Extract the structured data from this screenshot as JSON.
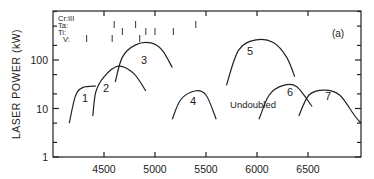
{
  "chart_data": {
    "type": "line",
    "title": "",
    "panel_label": "(a)",
    "xlabel": "",
    "ylabel": "LASER POWER (kW)",
    "xscale": "linear",
    "yscale": "log",
    "xlim": [
      4000,
      7000
    ],
    "ylim": [
      1,
      1000
    ],
    "x_ticks": [
      4500,
      5000,
      5500,
      6000,
      6500
    ],
    "y_ticks": [
      1,
      10,
      100
    ],
    "y_tick_labels": [
      "1",
      "10",
      "100"
    ],
    "annotation": "Undoubled",
    "legend": {
      "position": "upper-left",
      "entries": [
        {
          "label": "Cr:III",
          "marks_x": []
        },
        {
          "label": "Ta:",
          "marks_x": [
            4600,
            4810,
            5400
          ]
        },
        {
          "label": "Ti:",
          "marks_x": [
            4680,
            4910,
            5000,
            5180
          ]
        },
        {
          "label": "V:",
          "marks_x": [
            4330,
            4580,
            4850
          ]
        }
      ]
    },
    "series": [
      {
        "name": "1",
        "x": [
          4160,
          4220,
          4290,
          4420
        ],
        "y": [
          5,
          18,
          27,
          29
        ]
      },
      {
        "name": "2",
        "x": [
          4390,
          4420,
          4500,
          4640,
          4790,
          4910
        ],
        "y": [
          7,
          22,
          45,
          75,
          53,
          23
        ]
      },
      {
        "name": "3",
        "x": [
          4610,
          4680,
          4810,
          4960,
          5070,
          5170
        ],
        "y": [
          35,
          115,
          205,
          225,
          160,
          70
        ]
      },
      {
        "name": "4",
        "x": [
          5170,
          5250,
          5390,
          5500,
          5600
        ],
        "y": [
          6,
          15,
          23,
          19,
          6
        ]
      },
      {
        "name": "5",
        "x": [
          5700,
          5820,
          5990,
          6160,
          6290,
          6370
        ],
        "y": [
          30,
          160,
          260,
          230,
          115,
          45
        ]
      },
      {
        "name": "6",
        "x": [
          6020,
          6120,
          6260,
          6390,
          6540
        ],
        "y": [
          6,
          19,
          30,
          28,
          11
        ]
      },
      {
        "name": "7",
        "x": [
          6410,
          6510,
          6660,
          6810,
          6960,
          7020
        ],
        "y": [
          7,
          19,
          24,
          19,
          7,
          5
        ]
      }
    ]
  }
}
